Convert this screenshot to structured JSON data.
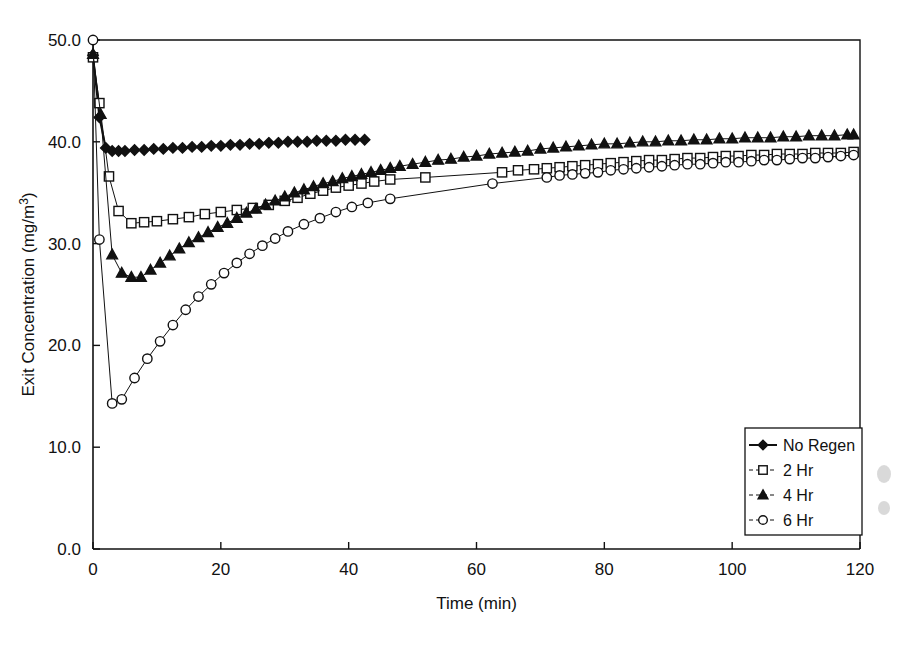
{
  "chart_data": {
    "type": "line",
    "title": "",
    "xlabel": "Time (min)",
    "ylabel": "Exit Concentration (mg/m3)",
    "ylabel_display": "Exit Concentration (mg/m",
    "ylabel_superscript": "3",
    "ylabel_tail": ")",
    "xlim": [
      0,
      120
    ],
    "ylim": [
      0,
      50
    ],
    "xticks": [
      0,
      20,
      40,
      60,
      80,
      100,
      120
    ],
    "xtick_labels": [
      "0",
      "20",
      "40",
      "60",
      "80",
      "100",
      "120"
    ],
    "yticks": [
      0,
      10,
      20,
      30,
      40,
      50
    ],
    "ytick_labels": [
      "0.0",
      "10.0",
      "20.0",
      "30.0",
      "40.0",
      "50.0"
    ],
    "grid": false,
    "legend_position": "bottom-right",
    "series": [
      {
        "name": "No Regen",
        "marker": "filled-diamond",
        "x": [
          0,
          1,
          2,
          3,
          4,
          5,
          6.5,
          8,
          9.5,
          11,
          12.5,
          14,
          15.5,
          17,
          18.5,
          20,
          21.5,
          23,
          24.5,
          26,
          27.5,
          29,
          30.5,
          32,
          33.5,
          35,
          36.5,
          38,
          39.5,
          41,
          42.5
        ],
        "y": [
          48.5,
          42.4,
          39.4,
          39.1,
          39.1,
          39.1,
          39.2,
          39.2,
          39.3,
          39.3,
          39.4,
          39.4,
          39.5,
          39.5,
          39.6,
          39.6,
          39.7,
          39.7,
          39.8,
          39.8,
          39.9,
          39.9,
          40.0,
          40.0,
          40.0,
          40.1,
          40.1,
          40.1,
          40.2,
          40.2,
          40.2
        ]
      },
      {
        "name": "2 Hr",
        "marker": "open-square",
        "x": [
          0,
          1,
          2.5,
          4,
          6,
          8,
          10,
          12.5,
          15,
          17.5,
          20,
          22.5,
          25,
          27.5,
          30,
          32,
          34,
          36,
          38,
          40,
          42,
          44,
          46.5,
          52,
          64,
          66.5,
          69,
          71,
          73,
          75,
          77,
          79,
          81,
          83,
          85,
          87,
          89,
          91,
          93,
          95,
          97,
          99,
          101,
          103,
          105,
          107,
          109,
          111,
          113,
          115,
          117,
          119
        ],
        "y": [
          48.3,
          43.8,
          36.6,
          33.2,
          32.0,
          32.1,
          32.2,
          32.4,
          32.6,
          32.9,
          33.1,
          33.3,
          33.5,
          33.8,
          34.2,
          34.5,
          34.9,
          35.2,
          35.5,
          35.7,
          35.9,
          36.1,
          36.3,
          36.5,
          37.0,
          37.2,
          37.3,
          37.4,
          37.5,
          37.6,
          37.7,
          37.8,
          37.9,
          38.0,
          38.1,
          38.2,
          38.2,
          38.3,
          38.4,
          38.4,
          38.5,
          38.6,
          38.6,
          38.7,
          38.7,
          38.8,
          38.8,
          38.8,
          38.9,
          38.9,
          38.9,
          39.0
        ]
      },
      {
        "name": "4 Hr",
        "marker": "filled-triangle",
        "x": [
          0,
          1.2,
          3,
          4.5,
          6,
          7.5,
          9,
          10.5,
          12,
          13.5,
          15,
          16.5,
          18,
          19.5,
          21,
          22.5,
          24,
          25.5,
          27,
          28.5,
          30,
          31.5,
          33,
          34.5,
          36,
          37.5,
          39,
          40.5,
          42,
          43.5,
          45,
          46.5,
          48,
          50,
          52,
          54,
          56,
          58,
          60,
          62,
          64,
          66,
          68,
          70,
          72,
          74,
          76,
          78,
          80,
          82,
          84,
          86,
          88,
          90,
          92,
          94,
          96,
          98,
          100,
          102,
          104,
          106,
          108,
          110,
          112,
          114,
          116,
          118,
          119
        ],
        "y": [
          48.6,
          42.7,
          28.9,
          27.1,
          26.7,
          26.7,
          27.4,
          28.1,
          28.8,
          29.5,
          30.1,
          30.6,
          31.1,
          31.6,
          32.0,
          32.5,
          33.0,
          33.4,
          33.8,
          34.2,
          34.6,
          35.0,
          35.3,
          35.6,
          35.9,
          36.1,
          36.4,
          36.6,
          36.8,
          37.0,
          37.2,
          37.4,
          37.6,
          37.8,
          38.0,
          38.2,
          38.3,
          38.5,
          38.6,
          38.8,
          38.9,
          39.0,
          39.1,
          39.3,
          39.4,
          39.5,
          39.6,
          39.7,
          39.8,
          39.8,
          39.9,
          40.0,
          40.0,
          40.1,
          40.1,
          40.2,
          40.2,
          40.3,
          40.3,
          40.4,
          40.4,
          40.4,
          40.5,
          40.5,
          40.6,
          40.6,
          40.6,
          40.7,
          40.7
        ]
      },
      {
        "name": "6 Hr",
        "marker": "open-circle",
        "x": [
          0,
          1,
          3,
          4.5,
          6.5,
          8.5,
          10.5,
          12.5,
          14.5,
          16.5,
          18.5,
          20.5,
          22.5,
          24.5,
          26.5,
          28.5,
          30.5,
          33,
          35.5,
          38,
          40.5,
          43,
          46.5,
          62.5,
          71,
          73,
          75,
          77,
          79,
          81,
          83,
          85,
          87,
          89,
          91,
          93,
          95,
          97,
          99,
          101,
          103,
          105,
          107,
          109,
          111,
          113,
          115,
          117,
          119
        ],
        "y": [
          50.0,
          30.4,
          14.3,
          14.7,
          16.8,
          18.7,
          20.4,
          22.0,
          23.5,
          24.8,
          26.0,
          27.1,
          28.1,
          29.0,
          29.8,
          30.5,
          31.2,
          31.9,
          32.5,
          33.1,
          33.6,
          34.0,
          34.4,
          35.9,
          36.5,
          36.7,
          36.8,
          36.9,
          37.0,
          37.2,
          37.3,
          37.4,
          37.5,
          37.6,
          37.7,
          37.8,
          37.8,
          37.9,
          38.0,
          38.0,
          38.1,
          38.2,
          38.2,
          38.3,
          38.4,
          38.4,
          38.5,
          38.6,
          38.7
        ]
      }
    ]
  },
  "legend": {
    "entries": [
      {
        "label": "No Regen",
        "marker": "filled-diamond"
      },
      {
        "label": "2 Hr",
        "marker": "open-square"
      },
      {
        "label": "4 Hr",
        "marker": "filled-triangle"
      },
      {
        "label": "6 Hr",
        "marker": "open-circle"
      }
    ]
  },
  "colors": {
    "ink": "#111111",
    "background": "#ffffff"
  }
}
